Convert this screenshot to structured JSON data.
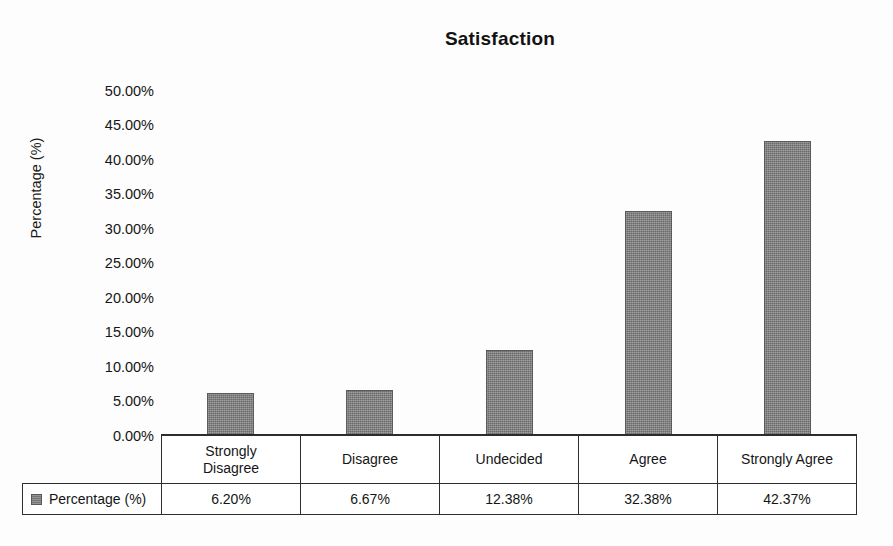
{
  "chart_data": {
    "type": "bar",
    "title": "Satisfaction",
    "xlabel": "",
    "ylabel": "Percentage (%)",
    "ylim": [
      0,
      50
    ],
    "grid": false,
    "legend_position": "table-left",
    "categories": [
      "Strongly Disagree",
      "Disagree",
      "Undecided",
      "Agree",
      "Strongly Agree"
    ],
    "values": [
      6.2,
      6.67,
      12.38,
      32.38,
      42.37
    ],
    "value_labels": [
      "6.20%",
      "6.67%",
      "12.38%",
      "32.38%",
      "42.37%"
    ],
    "series": [
      {
        "name": "Percentage (%)",
        "values": [
          6.2,
          6.67,
          12.38,
          32.38,
          42.37
        ],
        "color": "#838383"
      }
    ],
    "ytick_labels": [
      "50.00%",
      "45.00%",
      "40.00%",
      "35.00%",
      "30.00%",
      "25.00%",
      "20.00%",
      "15.00%",
      "10.00%",
      "5.00%",
      "0.00%"
    ],
    "ytick_values": [
      50,
      45,
      40,
      35,
      30,
      25,
      20,
      15,
      10,
      5,
      0
    ]
  },
  "table": {
    "category_labels": [
      "Strongly\nDisagree",
      "Disagree",
      "Undecided",
      "Agree",
      "Strongly Agree"
    ],
    "legend_row_label": "Percentage (%)",
    "value_row": [
      "6.20%",
      "6.67%",
      "12.38%",
      "32.38%",
      "42.37%"
    ]
  },
  "colors": {
    "bar_fill": "#838383",
    "bar_stroke": "#5a5a5a",
    "axis": "#2b2b2b",
    "text": "#151515",
    "background": "#fdfdfd"
  }
}
